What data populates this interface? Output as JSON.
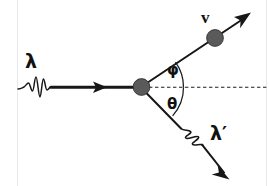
{
  "figure": {
    "background_color": "#ffffff",
    "ink_color": "#171717",
    "particle_color": "#5a5a5a",
    "width": 269,
    "height": 186
  },
  "labels": {
    "incident_photon": "λ",
    "scattered_photon": "λ′",
    "electron_velocity": "v",
    "electron_angle": "φ",
    "photon_angle": "θ"
  },
  "elements": {
    "incident_photon_wave": "incident-photon-wavepacket",
    "incident_photon_ray": "incident-photon-ray",
    "incident_arrowhead": "incident-photon-arrowhead",
    "target_electron_dot": "target-electron-vertex",
    "axis": "horizontal-reference-axis",
    "electron_track": "recoil-electron-track",
    "electron_dot": "recoil-electron-dot",
    "electron_arrowhead": "recoil-electron-arrowhead",
    "scattered_photon_ray": "scattered-photon-ray",
    "scattered_photon_wave": "scattered-photon-wavepacket",
    "scattered_arrowhead": "scattered-photon-arrowhead",
    "phi_arc": "phi-angle-arc",
    "theta_arc": "theta-angle-arc"
  },
  "geometry": {
    "vertex": {
      "x": 141,
      "y": 87
    },
    "electron_angle_deg": 37,
    "photon_angle_deg": 42,
    "electron_arrow_tip": {
      "x": 250,
      "y": 14
    },
    "photon_arrow_tip": {
      "x": 228,
      "y": 178
    }
  },
  "label_positions": {
    "incident_photon": {
      "left": 25,
      "top": 52
    },
    "scattered_photon": {
      "left": 210,
      "top": 124
    },
    "electron_velocity": {
      "left": 201,
      "top": 9
    },
    "electron_angle": {
      "left": 166,
      "top": 63
    },
    "photon_angle": {
      "left": 166,
      "top": 96
    }
  }
}
